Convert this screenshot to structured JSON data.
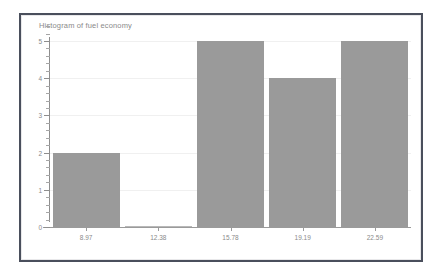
{
  "chart_data": {
    "type": "bar",
    "title": "Histogram of fuel economy",
    "xlabel": "",
    "ylabel": "",
    "categories": [
      "8.97",
      "12.38",
      "15.78",
      "19.19",
      "22.59"
    ],
    "values": [
      2,
      0,
      5,
      4,
      5
    ],
    "ylim": [
      0,
      5
    ],
    "y_ticks": [
      "0",
      "1",
      "2",
      "3",
      "4",
      "5"
    ],
    "x_ticks": [
      "8.97",
      "12.38",
      "15.78",
      "19.19",
      "22.59"
    ],
    "grid": false,
    "legend": null,
    "bar_color": "#9a9a9a",
    "axis_color": "#8e8e8e",
    "text_color": "#8a8a8a",
    "frame_color": "#4a4f5c",
    "background": "#ffffff"
  }
}
